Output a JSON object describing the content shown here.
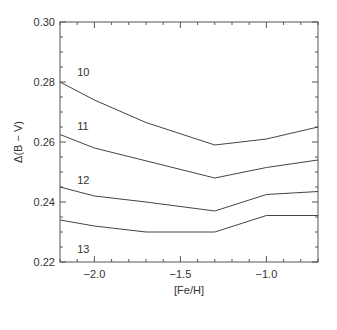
{
  "chart_data": {
    "type": "line",
    "title": "",
    "xlabel": "[Fe/H]",
    "ylabel": "Δ(B − V)",
    "xlim": [
      -2.2,
      -0.7
    ],
    "ylim": [
      0.22,
      0.3
    ],
    "grid": false,
    "legend": "inline labels near left axis",
    "x_ticks": [
      {
        "value": -2.0,
        "label": "−2.0"
      },
      {
        "value": -1.5,
        "label": "−1.5"
      },
      {
        "value": -1.0,
        "label": "−1.0"
      }
    ],
    "x_minor_step": 0.1,
    "y_ticks": [
      {
        "value": 0.3,
        "label": "0.30"
      },
      {
        "value": 0.28,
        "label": "0.28"
      },
      {
        "value": 0.26,
        "label": "0.26"
      },
      {
        "value": 0.24,
        "label": "0.24"
      },
      {
        "value": 0.22,
        "label": "0.22"
      }
    ],
    "y_minor_step": 0.005,
    "series": [
      {
        "name": "10",
        "label_pos": {
          "x": -2.1,
          "y": 0.2835
        },
        "x": [
          -2.2,
          -2.0,
          -1.7,
          -1.3,
          -1.0,
          -0.7
        ],
        "values": [
          0.28,
          0.274,
          0.2665,
          0.259,
          0.261,
          0.265
        ]
      },
      {
        "name": "11",
        "label_pos": {
          "x": -2.1,
          "y": 0.2655
        },
        "x": [
          -2.2,
          -2.0,
          -1.3,
          -1.0,
          -0.7
        ],
        "values": [
          0.2625,
          0.258,
          0.248,
          0.2515,
          0.254
        ]
      },
      {
        "name": "12",
        "label_pos": {
          "x": -2.1,
          "y": 0.2475
        },
        "x": [
          -2.2,
          -2.0,
          -1.7,
          -1.3,
          -1.0,
          -0.7
        ],
        "values": [
          0.245,
          0.242,
          0.24,
          0.237,
          0.2425,
          0.2435
        ]
      },
      {
        "name": "13",
        "label_pos": {
          "x": -2.1,
          "y": 0.2245
        },
        "x": [
          -2.2,
          -2.0,
          -1.7,
          -1.3,
          -1.0,
          -0.7
        ],
        "values": [
          0.234,
          0.232,
          0.23,
          0.23,
          0.2355,
          0.2355
        ]
      }
    ]
  },
  "layout": {
    "plot": {
      "left": 60,
      "right": 318,
      "top": 22,
      "bottom": 262
    },
    "line_color": "#444444",
    "axis_color": "#555555"
  }
}
